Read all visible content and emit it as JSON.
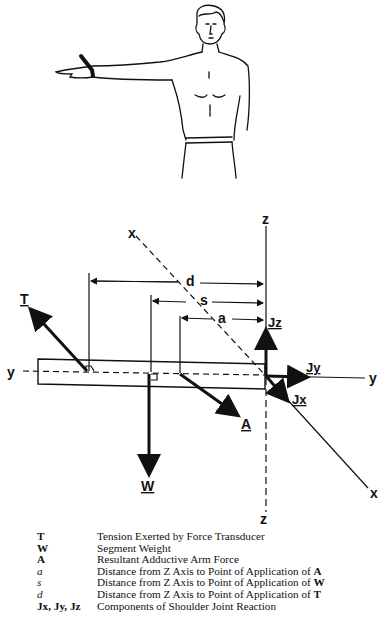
{
  "figure": {
    "illustration": "man-standing-arm-abducted-with-wrist-cuff",
    "diagram": {
      "axes": {
        "x_top": "x",
        "x_bottom": "x",
        "y_left": "y",
        "y_right": "y",
        "z_top": "z",
        "z_bottom": "z"
      },
      "dimensions": {
        "d": "d",
        "s": "s",
        "a": "a"
      },
      "forces": {
        "T": "T",
        "W": "W",
        "A": "A",
        "Jx": "Jx",
        "Jy": "Jy",
        "Jz": "Jz"
      }
    },
    "legend": [
      {
        "symbol": "T",
        "style": "bold",
        "description": "Tension Exerted by Force Transducer",
        "suffix": ""
      },
      {
        "symbol": "W",
        "style": "bold",
        "description": "Segment Weight",
        "suffix": ""
      },
      {
        "symbol": "A",
        "style": "bold",
        "description": "Resultant Adductive Arm Force",
        "suffix": ""
      },
      {
        "symbol": "a",
        "style": "italic",
        "description": "Distance from Z Axis to Point of Application of",
        "suffix": "A"
      },
      {
        "symbol": "s",
        "style": "italic",
        "description": "Distance from Z Axis to Point of Application of",
        "suffix": "W"
      },
      {
        "symbol": "d",
        "style": "italic",
        "description": "Distance from Z Axis to Point of Application of",
        "suffix": "T"
      },
      {
        "symbol": "Jx, Jy, Jz",
        "style": "bold",
        "description": "Components of Shoulder Joint Reaction",
        "suffix": ""
      }
    ]
  }
}
